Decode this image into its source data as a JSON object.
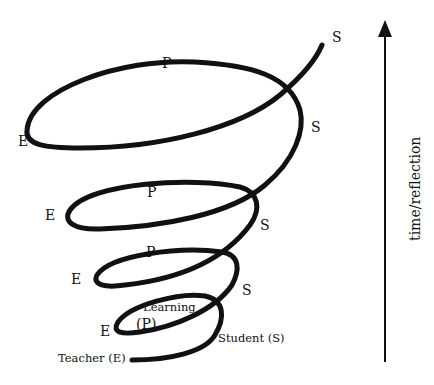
{
  "diagram": {
    "type": "spiral",
    "axis": {
      "label": "time/reflection",
      "direction": "up"
    },
    "start_labels": {
      "teacher": "Teacher (E)",
      "learning_word": "Learning",
      "learning_code": "(P)",
      "student": "Student (S)"
    },
    "loops": [
      {
        "level": 1,
        "E": "E",
        "P": "(P)",
        "S": "S"
      },
      {
        "level": 2,
        "E": "E",
        "P": "P",
        "S": "S"
      },
      {
        "level": 3,
        "E": "E",
        "P": "P",
        "S": "S"
      },
      {
        "level": 4,
        "E": "E",
        "P": "P",
        "S": "S"
      },
      {
        "level": 5,
        "S": "S"
      }
    ],
    "stroke_color": "#111111"
  }
}
